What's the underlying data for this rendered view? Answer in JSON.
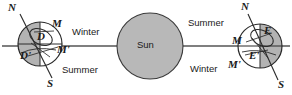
{
  "figure": {
    "background_color": "#ffffff",
    "ink_color": "#1a1a1a",
    "shade_color": "#b3b3b3",
    "sun_fill_color": "#b8b8b8",
    "light_fill_color": "#ffffff"
  },
  "sun": {
    "label": "Sun",
    "center_x": 150,
    "center_y": 46,
    "radius": 33
  },
  "orbit_line": {
    "name": "ecliptic-line",
    "y": 46,
    "x_start": 2,
    "x_end": 290
  },
  "earth_left": {
    "center_x": 40,
    "center_y": 44,
    "radius": 22,
    "shaded_side": "left",
    "axis_labels": {
      "north": "N",
      "south": "S"
    },
    "point_labels": {
      "d": "D",
      "d_prime": "D'",
      "m": "M",
      "m_prime": "M'"
    },
    "seasons": {
      "upper": "Winter",
      "lower": "Summer"
    }
  },
  "earth_right": {
    "center_x": 260,
    "center_y": 46,
    "radius": 22,
    "shaded_side": "right",
    "axis_labels": {
      "north": "N",
      "south": "S"
    },
    "point_labels": {
      "e": "E",
      "e_prime": "E'",
      "m": "M",
      "m_prime": "M'"
    },
    "seasons": {
      "upper": "Summer",
      "lower": "Winter"
    }
  }
}
